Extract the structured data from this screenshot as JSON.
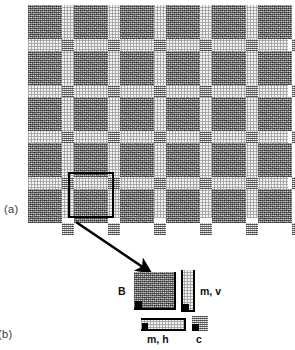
{
  "figure": {
    "panels": [
      {
        "key": "a",
        "label": "(a)"
      },
      {
        "key": "b",
        "label": "(b)"
      }
    ]
  },
  "wall": {
    "description": "periodic masonry wall pattern",
    "rows": 5,
    "columns": 7,
    "brick_width": 34,
    "brick_height": 34,
    "mortar_vertical_width": 12,
    "mortar_horizontal_height": 12,
    "origin_x": 28,
    "origin_y": 5,
    "width": 260,
    "height": 213,
    "highlight": {
      "name": "representative-volume-element",
      "x": 40,
      "y": 167,
      "width": 46,
      "height": 46,
      "stroke": "#000000",
      "stroke_width": 2.5
    }
  },
  "arrow": {
    "from_x": 6,
    "from_y": 4,
    "to_x": 80,
    "to_y": 54
  },
  "legend": {
    "items": [
      {
        "id": "brick",
        "label": "B",
        "texture": "brick",
        "label_position": "left"
      },
      {
        "id": "mortar-vertical",
        "label": "m, v",
        "texture": "mortar",
        "label_position": "right"
      },
      {
        "id": "mortar-horizontal",
        "label": "m, h",
        "texture": "mortar",
        "label_position": "below"
      },
      {
        "id": "cross-joint",
        "label": "c",
        "texture": "cross",
        "label_position": "below"
      }
    ]
  },
  "colors": {
    "brick": "#8d8d8d",
    "mortar": "#f4f4f2",
    "cross": "#d8d8d6",
    "outline": "#000000",
    "background": "#ffffff",
    "label_text": "#3a3a3a"
  }
}
